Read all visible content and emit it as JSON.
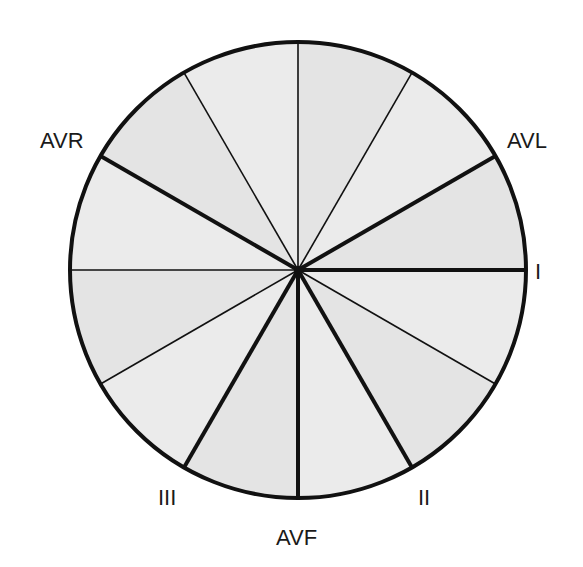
{
  "diagram": {
    "center": [
      298,
      270
    ],
    "radius": 228,
    "colors": {
      "fill": "#e4e4e4",
      "fill_alt": "#ebebeb",
      "stroke": "#111111",
      "label": "#1a1a1a"
    },
    "lead_axes": [
      {
        "name": "I",
        "angle_deg": 0
      },
      {
        "name": "II",
        "angle_deg": 60
      },
      {
        "name": "AVF",
        "angle_deg": 90
      },
      {
        "name": "III",
        "angle_deg": 120
      },
      {
        "name": "AVR",
        "angle_deg": -150
      },
      {
        "name": "AVL",
        "angle_deg": -30
      }
    ],
    "minor_axes_deg": [
      30,
      150,
      180,
      -60,
      -90,
      -120
    ]
  },
  "labels": {
    "I": {
      "text": "I",
      "x": 535,
      "y": 261
    },
    "II": {
      "text": "II",
      "x": 418,
      "y": 487
    },
    "III": {
      "text": "III",
      "x": 158,
      "y": 487
    },
    "AVF": {
      "text": "AVF",
      "x": 276,
      "y": 527
    },
    "AVR": {
      "text": "AVR",
      "x": 40,
      "y": 130
    },
    "AVL": {
      "text": "AVL",
      "x": 507,
      "y": 130
    }
  }
}
